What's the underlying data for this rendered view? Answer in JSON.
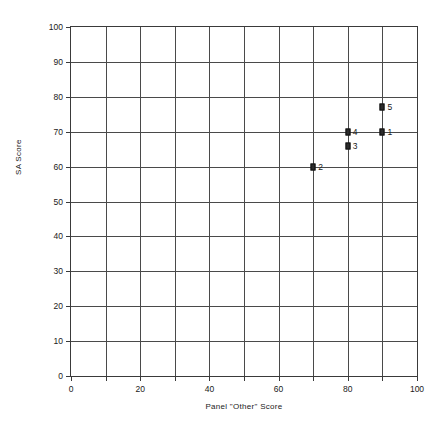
{
  "chart_data": {
    "type": "scatter",
    "title": "",
    "xlabel": "Panel \"Other\" Score",
    "ylabel": "SA Score",
    "xlim": [
      0,
      100
    ],
    "ylim": [
      0,
      100
    ],
    "grid": true,
    "grid_step_x": 10,
    "grid_step_y": 10,
    "legend": "none",
    "x_ticks_labeled": [
      0,
      20,
      40,
      60,
      80,
      100
    ],
    "y_ticks_labeled": [
      0,
      10,
      20,
      30,
      40,
      50,
      60,
      70,
      80,
      90,
      100
    ],
    "x_tick_labels": [
      "0",
      "20",
      "40",
      "60",
      "80",
      "100"
    ],
    "y_tick_labels": [
      "0",
      "10",
      "20",
      "30",
      "40",
      "50",
      "60",
      "70",
      "80",
      "90",
      "100"
    ],
    "points": [
      {
        "label": "1",
        "x": 90,
        "y": 70
      },
      {
        "label": "2",
        "x": 70,
        "y": 60
      },
      {
        "label": "3",
        "x": 80,
        "y": 66
      },
      {
        "label": "4",
        "x": 80,
        "y": 70
      },
      {
        "label": "5",
        "x": 90,
        "y": 77
      }
    ],
    "marker": "filled-square",
    "marker_color": "#2b2b2b"
  }
}
